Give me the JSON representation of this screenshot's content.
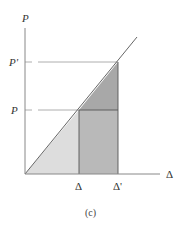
{
  "diagram": {
    "caption": "(c)",
    "axes": {
      "y_label": "P",
      "x_label": "Δ"
    },
    "y_ticks": [
      {
        "label": "P'",
        "level": "upper"
      },
      {
        "label": "P",
        "level": "lower"
      }
    ],
    "x_ticks": [
      {
        "label": "Δ",
        "position": "first"
      },
      {
        "label": "Δ'",
        "position": "second"
      }
    ],
    "regions": [
      {
        "name": "light-triangle",
        "color": "#dddddd"
      },
      {
        "name": "rectangle",
        "color": "#b9b9b9"
      },
      {
        "name": "dark-triangle",
        "color": "#a8a8a8"
      }
    ],
    "colors": {
      "axis": "#888888",
      "line": "#555555",
      "guide": "#999999"
    }
  }
}
